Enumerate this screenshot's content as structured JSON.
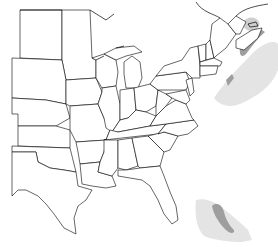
{
  "map": {
    "region": "Eastern United States and Atlantic Canada",
    "projection": "conic",
    "colors": {
      "background": "#ffffff",
      "state_border": "#000000",
      "range_light": "#e4e4e4",
      "range_mid": "#cfcfcf",
      "range_dark": "#9e9e9e"
    },
    "layers": [
      {
        "name": "state-boundaries",
        "type": "outline"
      },
      {
        "name": "range-north-atlantic",
        "type": "shaded-area",
        "shade": "light",
        "location": "Gulf of Maine to Nova Scotia offshore"
      },
      {
        "name": "range-gulf-st-lawrence",
        "type": "shaded-area",
        "shade": "mid",
        "location": "Gulf of St. Lawrence"
      },
      {
        "name": "range-nova-scotia-coast",
        "type": "shaded-area",
        "shade": "dark",
        "location": "Nova Scotia / New England coastline"
      },
      {
        "name": "range-south-florida",
        "type": "shaded-area",
        "shade": "light",
        "location": "South Florida / Straits"
      },
      {
        "name": "range-bahamas",
        "type": "shaded-area",
        "shade": "dark",
        "location": "Bahamas banks"
      }
    ]
  }
}
